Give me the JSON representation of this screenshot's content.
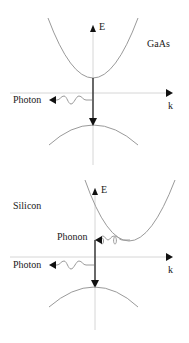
{
  "diagrams": [
    {
      "material": "GaAs",
      "axis_y_label": "E",
      "axis_x_label": "k",
      "emission_label": "Photon",
      "transition_type": "direct"
    },
    {
      "material": "Silicon",
      "axis_y_label": "E",
      "axis_x_label": "k",
      "emission_label": "Photon",
      "phonon_label": "Phonon",
      "transition_type": "indirect"
    }
  ],
  "colors": {
    "axis": "#d0d0d0",
    "band_curve": "#9a9a9a",
    "arrow": "#111111",
    "text": "#1a1a1a"
  }
}
